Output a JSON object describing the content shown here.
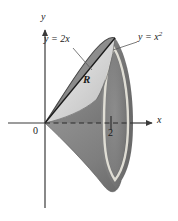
{
  "figure": {
    "background_color": "#ffffff",
    "axes": {
      "x_axis_label": "x",
      "y_axis_label": "y",
      "origin_label": "0",
      "x_tick_label": "2",
      "axis_color": "#3a3a3a",
      "axis_of_revolution_style": "dashed"
    },
    "curves": [
      {
        "id": "line",
        "label": "y = 2x",
        "equation_text": "y = 2x",
        "type": "line",
        "slope": 2,
        "color": "#1a1a1a"
      },
      {
        "id": "parabola",
        "label_base": "y = x",
        "label_exponent": "2",
        "equation_text": "y = x2",
        "type": "parabola",
        "color": "#1a1a1a"
      }
    ],
    "region": {
      "label": "R",
      "description": "Region between y = 2x and y = x squared from x = 0 to x = 2",
      "fill_light": "#d8d8d8",
      "fill_mid": "#b4b4b4"
    },
    "solid": {
      "description": "Solid of revolution generated by rotating R about the x-axis",
      "fill_dark": "#8a8a8a",
      "fill_darker": "#6f6f6f",
      "highlight_color": "#e8e6dc"
    },
    "intersection_points": [
      {
        "x": 0,
        "y": 0
      },
      {
        "x": 2,
        "y": 4
      }
    ]
  }
}
